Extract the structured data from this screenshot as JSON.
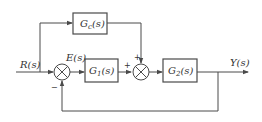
{
  "diagram": {
    "type": "control-block-diagram",
    "colors": {
      "line": "#4a4a4a",
      "text": "#333333",
      "background": "#ffffff"
    },
    "signals": {
      "input": "R(s)",
      "error": "E(s)",
      "output": "Y(s)"
    },
    "blocks": [
      {
        "id": "gc",
        "label": "Gc(s)",
        "main": "G",
        "sub": "c",
        "tail": "(s)"
      },
      {
        "id": "g1",
        "label": "G1(s)",
        "main": "G",
        "sub": "1",
        "tail": "(s)"
      },
      {
        "id": "g2",
        "label": "G2(s)",
        "main": "G",
        "sub": "2",
        "tail": "(s)"
      }
    ],
    "summing_junctions": [
      {
        "id": "sum1",
        "signs": {
          "left": "",
          "bottom": "−"
        }
      },
      {
        "id": "sum2",
        "signs": {
          "left": "+",
          "top": "+"
        }
      }
    ],
    "connections": [
      "R(s) -> sum1",
      "R(s) -> Gc(s) (feedforward)",
      "sum1 -> E(s) -> G1(s)",
      "G1(s) -> sum2 (+)",
      "Gc(s) -> sum2 (+)",
      "sum2 -> G2(s)",
      "G2(s) -> Y(s)",
      "Y(s) -> sum1 (−, unity feedback)"
    ]
  }
}
